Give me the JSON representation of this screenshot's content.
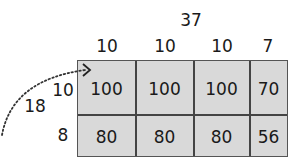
{
  "total_width_label": "37",
  "column_labels": [
    "10",
    "10",
    "10",
    "7"
  ],
  "total_height_label": "18",
  "row_labels": [
    "10",
    "8"
  ],
  "cells": [
    [
      "100",
      "100",
      "100",
      "70"
    ],
    [
      "80",
      "80",
      "80",
      "56"
    ]
  ],
  "colors": {
    "cell_fill": "#d9d9d9",
    "grid_line": "#444444",
    "text": "#1a1a1a"
  }
}
